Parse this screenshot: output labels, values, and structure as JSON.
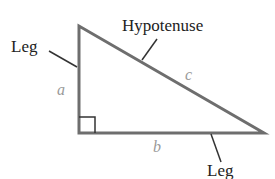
{
  "diagram": {
    "type": "right-triangle",
    "labels": {
      "hypotenuse": "Hypotenuse",
      "leg_left": "Leg",
      "leg_bottom": "Leg",
      "side_a": "a",
      "side_b": "b",
      "side_c": "c"
    },
    "colors": {
      "triangle_stroke": "#6e6e6e",
      "label_text": "#222222",
      "variable_text": "#9a9a9a"
    }
  }
}
